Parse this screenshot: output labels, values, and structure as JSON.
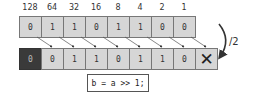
{
  "weights": [
    "128",
    "64",
    "32",
    "16",
    "8",
    "4",
    "2",
    "1"
  ],
  "input_bits": [
    "0",
    "1",
    "1",
    "0",
    "1",
    "1",
    "0",
    "0"
  ],
  "output_bits": [
    "0",
    "0",
    "1",
    "1",
    "0",
    "1",
    "1",
    "0"
  ],
  "discarded_marker": "✕",
  "operation_label": "/2",
  "code": "b = a >> 1;",
  "colors": {
    "cell": "#d6d6d6",
    "fill_bit": "#3a3a3a",
    "border": "#777777"
  }
}
